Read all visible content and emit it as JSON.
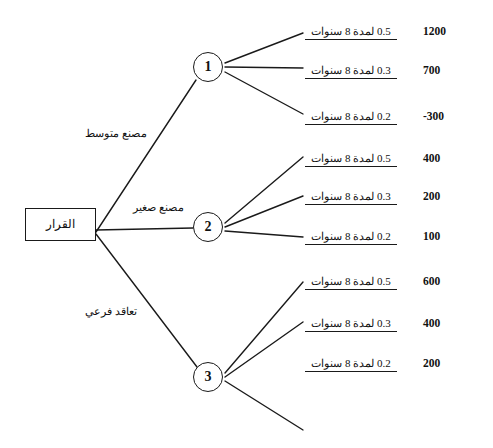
{
  "diagram": {
    "root": {
      "label": "القرار",
      "shape": "rectangle"
    },
    "branches": [
      {
        "label": "مصنع متوسط",
        "target_node": "1"
      },
      {
        "label": "مصنع صغير",
        "target_node": "2"
      },
      {
        "label": "تعاقد فرعي",
        "target_node": "3"
      }
    ],
    "nodes": [
      {
        "id": "1",
        "label": "1"
      },
      {
        "id": "2",
        "label": "2"
      },
      {
        "id": "3",
        "label": "3"
      }
    ],
    "outcomes": [
      {
        "prob": "0.5",
        "duration": "لمدة 8 سنوات",
        "text": "0.5 لمدة 8 سنوات",
        "payoff": "1200",
        "node": "1"
      },
      {
        "prob": "0.3",
        "duration": "لمدة 8 سنوات",
        "text": "0.3 لمدة 8 سنوات",
        "payoff": "700",
        "node": "1"
      },
      {
        "prob": "0.2",
        "duration": "لمدة 8 سنوات",
        "text": "0.2 لمدة 8 سنوات",
        "payoff": "-300",
        "node": "1"
      },
      {
        "prob": "0.5",
        "duration": "لمدة 8 سنوات",
        "text": "0.5 لمدة 8 سنوات",
        "payoff": "400",
        "node": "2"
      },
      {
        "prob": "0.3",
        "duration": "لمدة 8 سنوات",
        "text": "0.3 لمدة 8 سنوات",
        "payoff": "200",
        "node": "2"
      },
      {
        "prob": "0.2",
        "duration": "لمدة 8 سنوات",
        "text": "0.2 لمدة 8 سنوات",
        "payoff": "100",
        "node": "2"
      },
      {
        "prob": "0.5",
        "duration": "لمدة 8 سنوات",
        "text": "0.5 لمدة 8 سنوات",
        "payoff": "600",
        "node": "3"
      },
      {
        "prob": "0.3",
        "duration": "لمدة 8 سنوات",
        "text": "0.3 لمدة 8 سنوات",
        "payoff": "400",
        "node": "3"
      },
      {
        "prob": "0.2",
        "duration": "لمدة 8 سنوات",
        "text": "0.2 لمدة 8 سنوات",
        "payoff": "200",
        "node": "3"
      }
    ],
    "colors": {
      "line": "#1a1a1a",
      "background": "#ffffff",
      "text": "#111111"
    }
  }
}
